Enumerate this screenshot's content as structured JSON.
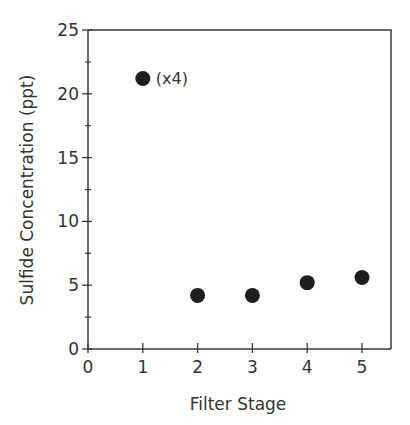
{
  "chart_data": {
    "type": "scatter",
    "title": "",
    "xlabel": "Filter Stage",
    "ylabel": "Sulfide Concentration (ppt)",
    "x": [
      1,
      2,
      3,
      4,
      5
    ],
    "series": [
      {
        "name": "Sulfide Concentration",
        "values": [
          21.2,
          4.2,
          4.2,
          5.2,
          5.6
        ]
      }
    ],
    "annotations": [
      {
        "x": 1,
        "y": 21.2,
        "text": "(x4)"
      }
    ],
    "xlim": [
      0,
      5.5
    ],
    "ylim": [
      0,
      25
    ],
    "xticks": [
      0,
      1,
      2,
      3,
      4,
      5
    ],
    "yticks": [
      0,
      5,
      10,
      15,
      20,
      25
    ],
    "y_minor_ticks": [
      2.5,
      7.5,
      12.5,
      17.5,
      22.5
    ],
    "grid": false,
    "legend": null
  }
}
